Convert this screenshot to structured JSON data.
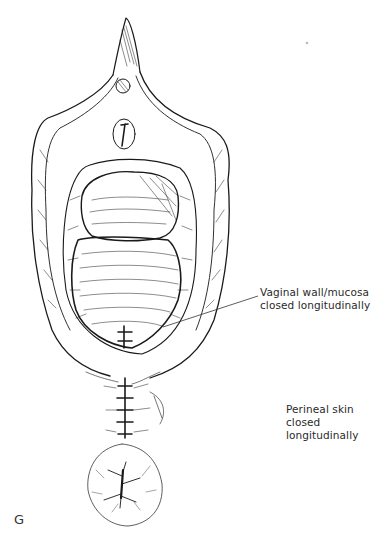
{
  "figure": {
    "panel_letter": "G",
    "labels": [
      {
        "id": "vaginal",
        "lines": [
          "Vaginal wall/mucosa",
          "closed longitudinally"
        ]
      },
      {
        "id": "perineal",
        "lines": [
          "Perineal skin closed",
          "longitudinally"
        ]
      }
    ],
    "colors": {
      "ink": "#1a1a1a",
      "background": "#ffffff",
      "text": "#2a2a2a"
    }
  }
}
